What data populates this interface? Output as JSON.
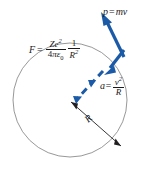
{
  "figure": {
    "width": 157,
    "height": 180,
    "background_color": "#ffffff",
    "circle": {
      "name": "orbit-circle",
      "stroke_color": "#8c8c8c",
      "center_x": 70,
      "center_y": 100,
      "radius": 57
    },
    "colors": {
      "vector_blue": "#1b5aa6",
      "orbit_gray": "#8c8c8c",
      "radius_black": "#231f20",
      "text_black": "#1a1a1a"
    }
  },
  "labels": {
    "momentum": {
      "name": "momentum-label",
      "p": "p",
      "equals": "=",
      "mv": "mv",
      "full": "p = mv"
    },
    "acceleration": {
      "name": "acceleration-label",
      "a": "a",
      "equals": "=",
      "numerator": "v",
      "numerator_exp": "2",
      "denominator": "R",
      "full": "a = v2/R"
    },
    "radius": {
      "name": "radius-label",
      "text": "R"
    },
    "force": {
      "name": "force-formula-label",
      "F": "F",
      "equals": "=",
      "frac1_num": "Ze",
      "frac1_num_exp": "2",
      "frac1_den_coef": "4",
      "frac1_den_pi": "π",
      "frac1_den_eps": "ε",
      "frac1_den_eps_sub": "0",
      "frac2_num": "1",
      "frac2_den": "R",
      "frac2_den_exp": "2",
      "full": "F = Ze2 / (4πε0) · 1/R2"
    }
  },
  "vectors": {
    "momentum_arrow": {
      "name": "momentum-vector-arrow",
      "color": "#1b5aa6",
      "style": "solid",
      "from_x": 122,
      "from_y": 56,
      "to_x": 102,
      "to_y": 15
    },
    "force_arrow": {
      "name": "force-vector-arrow",
      "color": "#1b5aa6",
      "style": "solid",
      "from_x": 122,
      "from_y": 50,
      "to_x": 104,
      "to_y": 73
    },
    "acceleration_arrow": {
      "name": "acceleration-vector-arrow",
      "color": "#1b5aa6",
      "style": "dashed",
      "from_x": 102,
      "from_y": 72,
      "to_x": 72,
      "to_y": 104
    },
    "radius_arrow": {
      "name": "radius-double-arrow",
      "color": "#231f20",
      "style": "solid",
      "from_x": 71,
      "from_y": 102,
      "to_x": 121,
      "to_y": 146
    }
  }
}
